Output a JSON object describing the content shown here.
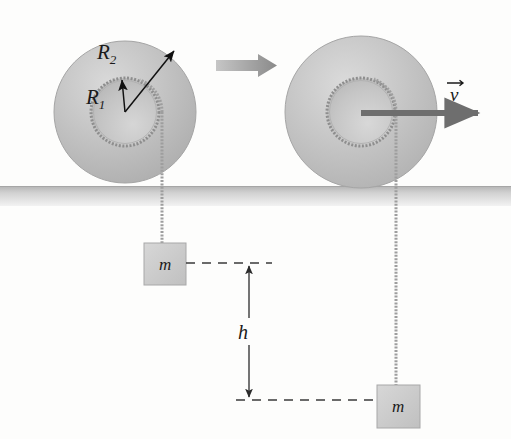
{
  "figure": {
    "background_color": "#fdfdfc",
    "ground": {
      "label": "ground-surface",
      "color_top": "#b9b9b9",
      "color_bottom": "#efefef",
      "y_top": 186,
      "y_bottom": 206
    }
  },
  "labels": {
    "radius_outer": "R",
    "radius_outer_sub": "2",
    "radius_inner": "R",
    "radius_inner_sub": "1",
    "mass_left": "m",
    "mass_right": "m",
    "height": "h",
    "velocity": "v",
    "velocity_vector_bar": "→"
  },
  "spool_left": {
    "name": "spool-left",
    "center_x": 125,
    "center_y": 112,
    "outer_radius": 71,
    "inner_radius": 34,
    "outer_fill": "#c2c2c2",
    "inner_fill": "#c9c9c9",
    "rim_color": "#9a9a9a"
  },
  "spool_right": {
    "name": "spool-right",
    "center_x": 361,
    "center_y": 112,
    "outer_radius": 76,
    "inner_radius": 34,
    "outer_fill": "#c2c2c2",
    "inner_fill": "#c9c9c9",
    "rim_color": "#9a9a9a"
  },
  "strings": {
    "left": {
      "x": 162,
      "y_top": 112,
      "y_bottom": 244,
      "color": "#9e9e9e"
    },
    "right": {
      "x": 396,
      "y_top": 112,
      "y_bottom": 386,
      "color": "#9e9e9e"
    }
  },
  "blocks": {
    "left": {
      "x": 144,
      "y": 243,
      "width": 42,
      "height": 42,
      "fill": "#cccccc",
      "stroke": "#a8a8a8"
    },
    "right": {
      "x": 377,
      "y": 385,
      "width": 43,
      "height": 43,
      "fill": "#cccccc",
      "stroke": "#a8a8a8"
    }
  },
  "dimension": {
    "name": "height-dimension-h",
    "arrow_x": 249,
    "y_top": 263,
    "y_bottom": 400,
    "dash_top_x1": 186,
    "dash_top_x2": 272,
    "dash_bottom_x1": 236,
    "dash_bottom_x2": 378,
    "color": "#2b2b2b"
  },
  "motion_arrow": {
    "name": "motion-direction-arrow",
    "x1": 216,
    "x2": 276,
    "y": 65,
    "color": "#8f8f8f"
  },
  "velocity_arrow": {
    "name": "velocity-arrow",
    "x1": 361,
    "x2": 487,
    "y": 113,
    "color": "#6e6e6e"
  },
  "radius_arrows": {
    "R2": {
      "x1": 125,
      "y1": 112,
      "x2": 176,
      "y2": 49,
      "color": "#111111"
    },
    "R1": {
      "x1": 125,
      "y1": 112,
      "x2": 122,
      "y2": 78,
      "color": "#111111"
    }
  }
}
